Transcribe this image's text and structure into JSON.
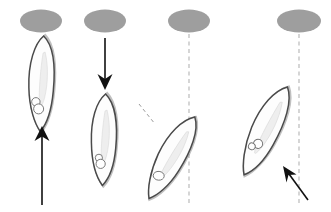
{
  "figure": {
    "width": 331,
    "height": 212,
    "background_color": "#ffffff",
    "panel_count": 4
  },
  "colors": {
    "source_fill": "#9e9e9e",
    "cell_stroke": "#4a4a4a",
    "cell_fill": "#fdfdfd",
    "cell_shadow_stroke": "#8d8d8d",
    "organelle_stroke": "#6f6f6f",
    "arrow": "#111111",
    "reference_axis": "#b4b4b4",
    "cell_axis": "#9a9a9a",
    "background": "#ffffff"
  },
  "panels": [
    {
      "id": "panel-1",
      "label": "a",
      "source": {
        "name": "source-ellipse-1",
        "cx": 41,
        "cy": 21,
        "rx": 21,
        "ry": 11.5,
        "fill": "#9e9e9e"
      },
      "cell": {
        "name": "cell-1",
        "cx": 42,
        "cy": 84,
        "length": 98,
        "width": 26,
        "angle_deg": 2,
        "organelles": 2
      },
      "arrow": {
        "name": "stimulus-arrow-up",
        "direction": "up",
        "x1": 42,
        "y1": 205,
        "x2": 42,
        "y2": 128,
        "style": "solid"
      },
      "reference_axis": null,
      "cell_axis": null
    },
    {
      "id": "panel-2",
      "label": "b",
      "source": {
        "name": "source-ellipse-2",
        "cx": 105,
        "cy": 21,
        "rx": 21,
        "ry": 11.5,
        "fill": "#9e9e9e"
      },
      "cell": {
        "name": "cell-2",
        "cx": 105,
        "cy": 140,
        "length": 93,
        "width": 25,
        "angle_deg": 2,
        "organelles": 2
      },
      "arrow": {
        "name": "stimulus-arrow-down",
        "direction": "down",
        "x1": 105,
        "y1": 38,
        "x2": 105,
        "y2": 88,
        "style": "solid"
      },
      "reference_axis": null,
      "cell_axis": null
    },
    {
      "id": "panel-3",
      "label": "c",
      "source": {
        "name": "source-ellipse-3",
        "cx": 189,
        "cy": 21,
        "rx": 21,
        "ry": 11.5,
        "fill": "#9e9e9e"
      },
      "cell": {
        "name": "cell-3",
        "cx": 172,
        "cy": 158,
        "length": 95,
        "width": 27,
        "angle_deg": 29,
        "organelles": 1
      },
      "arrow": null,
      "reference_axis": {
        "name": "reference-axis-vertical-3",
        "x1": 189,
        "y1": 34,
        "x2": 189,
        "y2": 206,
        "style": "dashed"
      },
      "cell_axis": {
        "name": "cell-long-axis-dashed-3",
        "x1": 139,
        "y1": 104,
        "x2": 155,
        "y2": 124,
        "style": "dashed"
      }
    },
    {
      "id": "panel-4",
      "label": "d",
      "source": {
        "name": "source-ellipse-4",
        "cx": 299,
        "cy": 21,
        "rx": 22,
        "ry": 11.5,
        "fill": "#9e9e9e"
      },
      "cell": {
        "name": "cell-4",
        "cx": 266,
        "cy": 131,
        "length": 100,
        "width": 28,
        "angle_deg": 26,
        "organelles": 2
      },
      "arrow": {
        "name": "stimulus-arrow-diagonal",
        "direction": "up-left",
        "x1": 307,
        "y1": 199,
        "x2": 284,
        "y2": 168,
        "style": "solid"
      },
      "reference_axis": {
        "name": "reference-axis-vertical-4",
        "x1": 299,
        "y1": 34,
        "x2": 299,
        "y2": 206,
        "style": "dashed"
      },
      "cell_axis": null
    }
  ]
}
